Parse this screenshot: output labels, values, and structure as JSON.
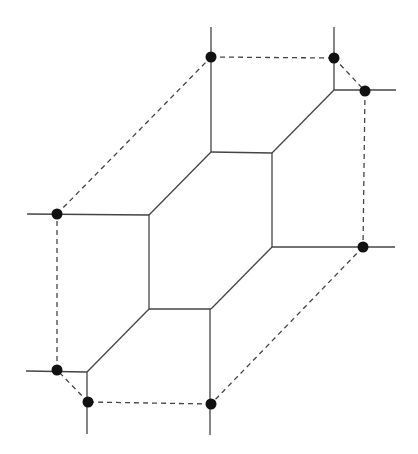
{
  "diagram": {
    "type": "tropical-curve-with-polytope",
    "colors": {
      "line": "#444444",
      "dot": "#111111",
      "background": "#ffffff"
    },
    "solid_segments": [
      [
        211,
        27,
        211,
        152
      ],
      [
        334,
        27,
        334,
        90
      ],
      [
        334,
        90,
        396,
        90
      ],
      [
        334,
        90,
        272,
        153
      ],
      [
        211,
        152,
        272,
        153
      ],
      [
        272,
        153,
        272,
        247
      ],
      [
        272,
        247,
        395,
        247
      ],
      [
        272,
        247,
        211,
        309
      ],
      [
        211,
        309,
        149,
        309
      ],
      [
        149,
        309,
        149,
        215
      ],
      [
        149,
        215,
        211,
        152
      ],
      [
        27,
        214,
        149,
        215
      ],
      [
        149,
        309,
        87,
        372
      ],
      [
        26,
        371,
        87,
        372
      ],
      [
        87,
        372,
        87,
        434
      ],
      [
        210,
        309,
        210,
        435
      ]
    ],
    "dashed_segments": [
      [
        211,
        57,
        334,
        58
      ],
      [
        334,
        58,
        365,
        91
      ],
      [
        365,
        91,
        363,
        247
      ],
      [
        363,
        247,
        211,
        404
      ],
      [
        211,
        404,
        88,
        402
      ],
      [
        88,
        402,
        57,
        370
      ],
      [
        57,
        370,
        57,
        214
      ],
      [
        57,
        214,
        211,
        57
      ]
    ],
    "dots": [
      [
        211,
        57
      ],
      [
        334,
        58
      ],
      [
        365,
        91
      ],
      [
        363,
        247
      ],
      [
        211,
        404
      ],
      [
        88,
        402
      ],
      [
        57,
        370
      ],
      [
        57,
        214
      ]
    ]
  }
}
